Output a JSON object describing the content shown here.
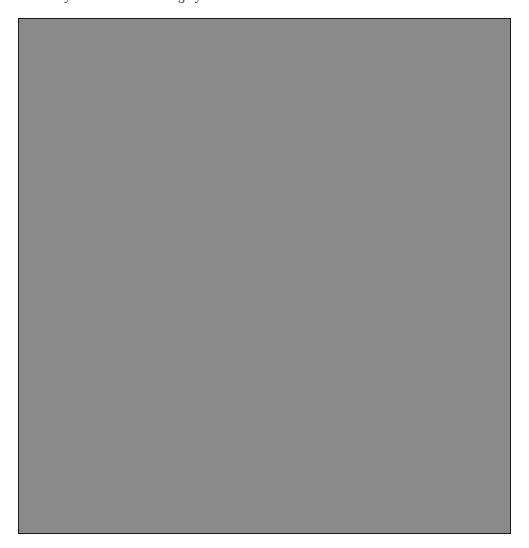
{
  "page": {
    "width_px": 529,
    "height_px": 548,
    "background_color": "#ffffff"
  },
  "caption": {
    "text": "uniformly distributed random grayscale values",
    "visibility": "clipped-at-top-edge",
    "color": "#2b2b2b"
  },
  "figure": {
    "name": "random-noise-image",
    "left_px": 18,
    "top_px": 18,
    "width_px": 493,
    "height_px": 516,
    "border_color": "#1a1a1a",
    "border_width_px": 1,
    "fill_description": "fine-grained uniform random grayscale pixel noise",
    "mean_gray_hex": "#8a8a8a",
    "min_gray_hex": "#000000",
    "max_gray_hex": "#ffffff",
    "grain_size_px": 1,
    "noise_seed": 20240517
  },
  "chart_data": {
    "type": "heatmap",
    "title": "",
    "xlabel": "",
    "ylabel": "",
    "grid": false,
    "legend": "none",
    "colormap": "gray",
    "value_range": [
      0,
      255
    ],
    "mean_value": 138,
    "distribution": "uniform",
    "rows": 516,
    "cols": 493
  }
}
